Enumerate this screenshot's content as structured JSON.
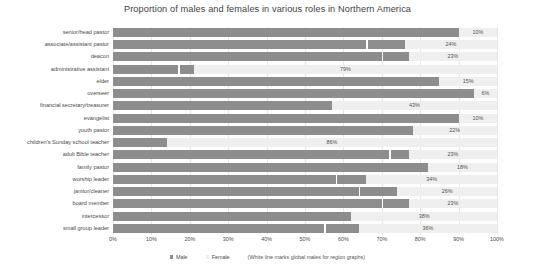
{
  "chart_data": {
    "type": "bar",
    "subtype": "stacked-horizontal-100pct",
    "title": "Proportion of males and females in various roles in Northern America",
    "xlabel": "",
    "ylabel": "",
    "xlim": [
      0,
      100
    ],
    "xticks": [
      "0%",
      "10%",
      "20%",
      "30%",
      "40%",
      "50%",
      "60%",
      "70%",
      "80%",
      "90%",
      "100%"
    ],
    "grid": true,
    "legend_position": "bottom",
    "categories": [
      "senior/head pastor",
      "associate/assistant pastor",
      "deacon",
      "administrative assistant",
      "elder",
      "overseer",
      "financial secretary/treasurer",
      "evangelist",
      "youth pastor",
      "children's Sunday school teacher",
      "adult Bible teacher",
      "family pastor",
      "worship leader",
      "janitor/cleaner",
      "board member",
      "intercessor",
      "small group leader"
    ],
    "series": [
      {
        "name": "Male",
        "color": "#8d8d8d",
        "values": [
          90,
          76,
          77,
          21,
          85,
          94,
          57,
          90,
          78,
          14,
          77,
          82,
          66,
          74,
          77,
          62,
          64
        ]
      },
      {
        "name": "Female",
        "color": "#efefef",
        "values": [
          10,
          24,
          23,
          79,
          15,
          6,
          43,
          10,
          22,
          86,
          23,
          18,
          34,
          26,
          23,
          38,
          36
        ]
      }
    ],
    "data_labels": {
      "series": "Female",
      "values": [
        "10%",
        "24%",
        "23%",
        "79%",
        "15%",
        "6%",
        "43%",
        "10%",
        "22%",
        "86%",
        "23%",
        "18%",
        "34%",
        "26%",
        "23%",
        "38%",
        "36%"
      ]
    },
    "white_line_marker": {
      "description": "White line marks global males for region graphs",
      "color": "#ffffff",
      "values": [
        null,
        66,
        70,
        17,
        null,
        null,
        null,
        null,
        null,
        null,
        72,
        null,
        58,
        64,
        70,
        null,
        55
      ]
    }
  },
  "legend": {
    "items": [
      {
        "label": "Male",
        "color": "#8d8d8d"
      },
      {
        "label": "Female",
        "color": "#efefef"
      }
    ],
    "note": "(White line marks global males for region graphs)"
  }
}
